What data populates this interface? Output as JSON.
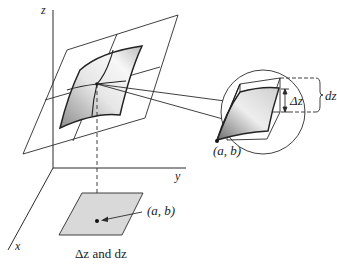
{
  "figure": {
    "title": "Δz and dz",
    "axes": {
      "x_label": "x",
      "y_label": "y",
      "z_label": "z"
    },
    "point_label_magnified": "(a, b)",
    "point_label_base": "(a, b)",
    "delta_z_label": "Δz",
    "dz_label": "dz",
    "caption": "Δz and dz"
  },
  "colors": {
    "line": "#2a2a2a",
    "surface_light": "#f2f2f2",
    "surface_dark": "#9a9a9a",
    "base_fill": "#d9d9d9"
  }
}
